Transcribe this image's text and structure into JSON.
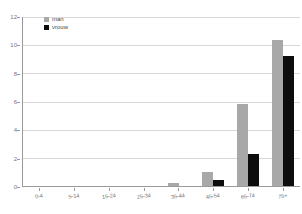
{
  "chart_data": {
    "type": "bar",
    "title": "",
    "subtitle": "",
    "xlabel": "",
    "ylabel": "",
    "grid": true,
    "legend_position": "top-left",
    "categories": [
      "0-4",
      "5-14",
      "15-24",
      "25-34",
      "35-44",
      "45-54",
      "65-74",
      "75+"
    ],
    "ylim": [
      0,
      12
    ],
    "yticks": [
      0,
      2,
      4,
      6,
      8,
      10,
      12
    ],
    "ytick_labels": [
      "0",
      "2",
      "4",
      "6",
      "8",
      "10",
      "12"
    ],
    "series": [
      {
        "name": "man",
        "color": "#a8a8a8",
        "values": [
          0,
          0,
          0,
          0,
          0.2,
          1.0,
          5.85,
          10.4
        ]
      },
      {
        "name": "vrouw",
        "color": "#0d0d0d",
        "values": [
          0,
          0,
          0,
          0,
          0,
          0.45,
          2.3,
          9.2
        ]
      }
    ]
  },
  "legend": {
    "items": [
      {
        "label": "man",
        "swatch": "man-swatch"
      },
      {
        "label": "vrouw",
        "swatch": "vrouw-swatch"
      }
    ]
  },
  "axes": {
    "y": {
      "labels": [
        "12",
        "10",
        "8",
        "6",
        "4",
        "2",
        "0"
      ]
    },
    "x": {
      "labels": [
        "0-4",
        "5-14",
        "15-24",
        "25-34",
        "35-44",
        "45-54",
        "65-74",
        "75+"
      ]
    }
  }
}
